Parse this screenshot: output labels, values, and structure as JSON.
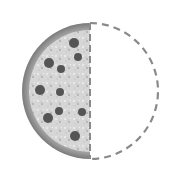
{
  "icon": {
    "name": "half-pizza-icon",
    "description": "Half of a pizza shown filled on the left, with the missing right half drawn as a dashed outline",
    "fraction": "1/2"
  },
  "geometry": {
    "center_x": 90,
    "center_y": 91,
    "radius": 68,
    "crust_width": 7
  },
  "colors": {
    "background": "#ffffff",
    "crust_outer": "#7a7a7a",
    "crust_inner": "#b4b4b4",
    "filling": "#d6d6d6",
    "speckle_light": "#eeeeee",
    "speckle_dark": "#a8a8a8",
    "topping": "#555555",
    "dashed_outline": "#8a8a8a"
  },
  "toppings": [
    {
      "cx": 74,
      "cy": 43,
      "r": 5
    },
    {
      "cx": 78,
      "cy": 57,
      "r": 4
    },
    {
      "cx": 49,
      "cy": 63,
      "r": 5
    },
    {
      "cx": 61,
      "cy": 69,
      "r": 4
    },
    {
      "cx": 40,
      "cy": 90,
      "r": 5
    },
    {
      "cx": 60,
      "cy": 92,
      "r": 4
    },
    {
      "cx": 59,
      "cy": 111,
      "r": 4
    },
    {
      "cx": 82,
      "cy": 112,
      "r": 4
    },
    {
      "cx": 48,
      "cy": 118,
      "r": 5
    },
    {
      "cx": 75,
      "cy": 136,
      "r": 5
    }
  ]
}
